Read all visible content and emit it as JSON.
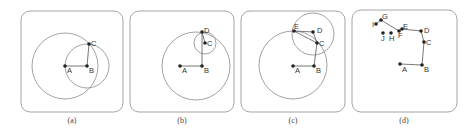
{
  "figure": {
    "panels": [
      {
        "id": "a",
        "caption": "(a)",
        "frame": {
          "x": 21,
          "y": 11,
          "w": 102,
          "h": 101
        },
        "circles": [
          {
            "cx": 65,
            "cy": 66,
            "r": 33
          },
          {
            "cx": 87,
            "cy": 66,
            "r": 22
          }
        ],
        "points": [
          {
            "label": "A",
            "x": 65,
            "y": 66,
            "lx": 67,
            "ly": 73
          },
          {
            "label": "B",
            "x": 87,
            "y": 66,
            "lx": 89,
            "ly": 73
          },
          {
            "label": "C",
            "x": 89,
            "y": 44,
            "lx": 91,
            "ly": 46
          }
        ],
        "segments": [
          [
            0,
            1
          ],
          [
            1,
            2
          ]
        ]
      },
      {
        "id": "b",
        "caption": "(b)",
        "frame": {
          "x": 130,
          "y": 11,
          "w": 104,
          "h": 101
        },
        "circles": [
          {
            "cx": 196,
            "cy": 66,
            "r": 34
          },
          {
            "cx": 205,
            "cy": 43,
            "r": 11
          }
        ],
        "points": [
          {
            "label": "A",
            "x": 180,
            "y": 66,
            "lx": 182,
            "ly": 73
          },
          {
            "label": "B",
            "x": 202,
            "y": 66,
            "lx": 204,
            "ly": 73
          },
          {
            "label": "C",
            "x": 205,
            "y": 43,
            "lx": 207,
            "ly": 46
          },
          {
            "label": "D",
            "x": 202,
            "y": 32,
            "lx": 204,
            "ly": 33
          }
        ],
        "segments": [
          [
            0,
            1
          ],
          [
            1,
            3
          ],
          [
            3,
            2
          ]
        ]
      },
      {
        "id": "c",
        "caption": "(c)",
        "frame": {
          "x": 241,
          "y": 11,
          "w": 104,
          "h": 101
        },
        "circles": [
          {
            "cx": 293,
            "cy": 65,
            "r": 34
          },
          {
            "cx": 313,
            "cy": 34,
            "r": 21
          }
        ],
        "points": [
          {
            "label": "A",
            "x": 293,
            "y": 66,
            "lx": 295,
            "ly": 73
          },
          {
            "label": "B",
            "x": 314,
            "y": 66,
            "lx": 316,
            "ly": 73
          },
          {
            "label": "C",
            "x": 317,
            "y": 43,
            "lx": 319,
            "ly": 46
          },
          {
            "label": "D",
            "x": 313,
            "y": 32,
            "lx": 317,
            "ly": 33
          },
          {
            "label": "E",
            "x": 294,
            "y": 31,
            "lx": 294,
            "ly": 29
          }
        ],
        "segments": [
          [
            0,
            1
          ],
          [
            1,
            2
          ],
          [
            2,
            3
          ],
          [
            3,
            4
          ],
          [
            4,
            2
          ]
        ]
      },
      {
        "id": "d",
        "caption": "(d)",
        "frame": {
          "x": 352,
          "y": 10,
          "w": 105,
          "h": 102
        },
        "circles": [],
        "points": [
          {
            "label": "A",
            "x": 400,
            "y": 64,
            "lx": 402,
            "ly": 72
          },
          {
            "label": "B",
            "x": 422,
            "y": 65,
            "lx": 424,
            "ly": 72
          },
          {
            "label": "C",
            "x": 424,
            "y": 42,
            "lx": 426,
            "ly": 45
          },
          {
            "label": "D",
            "x": 421,
            "y": 31,
            "lx": 424,
            "ly": 33
          },
          {
            "label": "E",
            "x": 402,
            "y": 29,
            "lx": 403,
            "ly": 29
          },
          {
            "label": "F",
            "x": 399,
            "y": 31,
            "lx": 398,
            "ly": 38
          },
          {
            "label": "G",
            "x": 381,
            "y": 20,
            "lx": 382,
            "ly": 19
          },
          {
            "label": "H",
            "x": 391,
            "y": 33,
            "lx": 389,
            "ly": 41
          },
          {
            "label": "I",
            "x": 376,
            "y": 24,
            "lx": 372,
            "ly": 27
          },
          {
            "label": "J",
            "x": 383,
            "y": 33,
            "lx": 381,
            "ly": 41
          }
        ],
        "segments": [
          [
            0,
            1
          ],
          [
            1,
            2
          ],
          [
            2,
            3
          ],
          [
            3,
            4
          ],
          [
            4,
            5
          ],
          [
            5,
            6
          ],
          [
            6,
            8
          ]
        ]
      }
    ],
    "captions": [
      "(a)",
      "(b)",
      "(c)",
      "(d)"
    ]
  }
}
